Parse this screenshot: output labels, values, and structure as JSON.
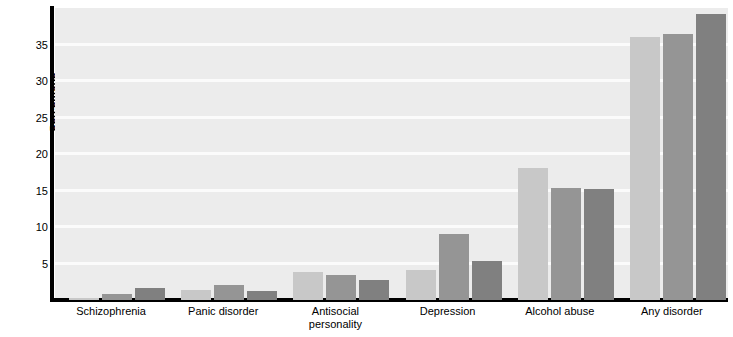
{
  "chart_data": {
    "type": "bar",
    "title": "",
    "xlabel": "",
    "ylabel": "Percentage",
    "ylim": [
      0,
      40
    ],
    "yticks": [
      5,
      10,
      15,
      20,
      25,
      30,
      35
    ],
    "grid": true,
    "legend": "none",
    "categories": [
      "Schizophrenia",
      "Panic disorder",
      "Antisocial personality",
      "Depression",
      "Alcohol abuse",
      "Any disorder"
    ],
    "category_lines": [
      [
        "Schizophrenia"
      ],
      [
        "Panic disorder"
      ],
      [
        "Antisocial",
        "personality"
      ],
      [
        "Depression"
      ],
      [
        "Alcohol abuse"
      ],
      [
        "Any disorder"
      ]
    ],
    "series": [
      {
        "name": "series-1",
        "color": "#c8c8c8",
        "values": [
          0.3,
          1.4,
          3.9,
          4.1,
          18.1,
          36.0
        ]
      },
      {
        "name": "series-2",
        "color": "#959595",
        "values": [
          0.8,
          2.0,
          3.4,
          9.0,
          15.4,
          36.5
        ]
      },
      {
        "name": "series-3",
        "color": "#808080",
        "values": [
          1.7,
          1.3,
          2.7,
          5.3,
          15.2,
          39.2
        ]
      }
    ],
    "colors": {
      "plot_background": "#ececec",
      "gridline": "#fbfbfb",
      "axis": "#000000",
      "series_light": "#c8c8c8",
      "series_medium": "#959595",
      "series_dark": "#808080"
    }
  }
}
